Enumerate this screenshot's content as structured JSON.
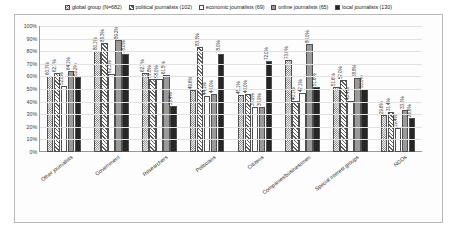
{
  "figure": {
    "background_color": "#ffffff",
    "frame_color": "#b9b9b9"
  },
  "chart_data": {
    "type": "bar",
    "title": "",
    "subtitle": "",
    "xlabel": "",
    "ylabel": "",
    "ylim": [
      0,
      100
    ],
    "grid": true,
    "legend_position": "top",
    "value_suffix": "%",
    "ytick_labels": [
      "100%",
      "90%",
      "80%",
      "70%",
      "60%",
      "50%",
      "40%",
      "30%",
      "20%",
      "10%",
      "0%"
    ],
    "ytick_values": [
      100,
      90,
      80,
      70,
      60,
      50,
      40,
      30,
      20,
      10,
      0
    ],
    "categories": [
      "Other journalists",
      "Government",
      "Researchers",
      "Politicians",
      "Citizens",
      "Companies/businessmen",
      "Special interest groups",
      "NGOs"
    ],
    "series": [
      {
        "name": "global group (N=682)",
        "swatch": "pat-s0",
        "color": "#6f6f6f",
        "values": [
          60.7,
          80.1,
          62.7,
          49.6,
          45.1,
          73.0,
          51.6,
          29.6
        ],
        "labels": [
          "60.7%",
          "80.1%",
          "62.7%",
          "49.6%",
          "45.1%",
          "73.0%",
          "51.6%",
          "29.6%"
        ]
      },
      {
        "name": "political journalists (102)",
        "swatch": "pat-s1",
        "color": "#5d5d5d",
        "values": [
          62.7,
          86.3,
          57.8,
          83.3,
          46.0,
          40.1,
          57.0,
          31.4
        ],
        "labels": [
          "62.7%",
          "86.3%",
          "57.8%",
          "83.3%",
          "46.0%",
          "40.1%",
          "57.0%",
          "31.4%"
        ]
      },
      {
        "name": "economic journalists (69)",
        "swatch": "pat-s2",
        "color": "#ffffff",
        "values": [
          52.0,
          62.3,
          58.0,
          44.1,
          35.9,
          47.1,
          40.4,
          19.4
        ],
        "labels": [
          "52.0%",
          "62.3%",
          "58.0%",
          "44.1%",
          "35.9%",
          "47.1%",
          "40.4%",
          "19.4%"
        ]
      },
      {
        "name": "online journalists (65)",
        "swatch": "pat-s3",
        "color": "#9a9a9a",
        "values": [
          64.1,
          89.2,
          61.5,
          46.0,
          35.9,
          86.0,
          58.8,
          33.6
        ],
        "labels": [
          "64.1%",
          "89.2%",
          "61.5%",
          "46.0%",
          "35.9%",
          "86.0%",
          "58.8%",
          "33.6%"
        ]
      },
      {
        "name": "local journalists (130)",
        "swatch": "pat-s4",
        "color": "#262626",
        "values": [
          59.2,
          78.0,
          36.4,
          78.0,
          72.0,
          51.6,
          50.0,
          26.6
        ],
        "labels": [
          "59.2%",
          "78.0%",
          "36.4%",
          "78.0%",
          "72.0%",
          "51.6%",
          "50.0%",
          "26.6%"
        ]
      }
    ],
    "extra_labels": {
      "other_journalists_fifth": "59.9%",
      "politicians_sixth": "45.1%",
      "special_interest_sixth": "35.4%",
      "special_interest_seventh": "55.1%"
    }
  }
}
